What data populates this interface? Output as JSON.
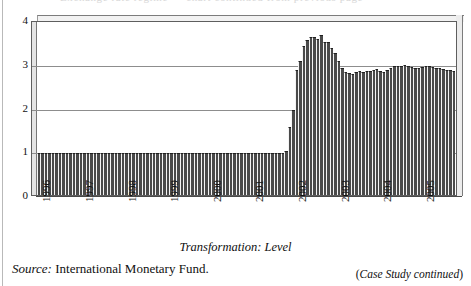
{
  "page": {
    "cutoff_header_ghost": "Exchange rate regime — chart continued from previous page",
    "margin_rule": "page-margin-rule"
  },
  "figure": {
    "transformation_caption": "Transformation: Level",
    "source_label": "Source:",
    "source_text": "International Monetary Fund.",
    "continued_note_open": "(",
    "continued_note_italic": "Case Study continued",
    "continued_note_close": ")"
  },
  "chart_data": {
    "type": "bar",
    "title": "",
    "subtitle": "Transformation: Level",
    "xlabel": "",
    "ylabel": "",
    "ylim": [
      0,
      4
    ],
    "yticks": [
      0,
      1,
      2,
      3,
      4
    ],
    "ytick_labels": [
      "0",
      "1",
      "2",
      "3",
      "4"
    ],
    "grid": true,
    "gridlines_at": [
      1,
      2,
      3
    ],
    "legend": "none",
    "bar_color": "#4a4a4a",
    "x_tick_labels": [
      "1996",
      "1997",
      "1998",
      "1999",
      "2000",
      "2001",
      "2002",
      "2003",
      "2004",
      "2005"
    ],
    "x_tick_label_rotation": -90,
    "x_frequency": "monthly",
    "x_range": [
      "1996-01",
      "2005-12"
    ],
    "series_name": "Exchange rate (level)",
    "categories": [
      "1996-01",
      "1996-02",
      "1996-03",
      "1996-04",
      "1996-05",
      "1996-06",
      "1996-07",
      "1996-08",
      "1996-09",
      "1996-10",
      "1996-11",
      "1996-12",
      "1997-01",
      "1997-02",
      "1997-03",
      "1997-04",
      "1997-05",
      "1997-06",
      "1997-07",
      "1997-08",
      "1997-09",
      "1997-10",
      "1997-11",
      "1997-12",
      "1998-01",
      "1998-02",
      "1998-03",
      "1998-04",
      "1998-05",
      "1998-06",
      "1998-07",
      "1998-08",
      "1998-09",
      "1998-10",
      "1998-11",
      "1998-12",
      "1999-01",
      "1999-02",
      "1999-03",
      "1999-04",
      "1999-05",
      "1999-06",
      "1999-07",
      "1999-08",
      "1999-09",
      "1999-10",
      "1999-11",
      "1999-12",
      "2000-01",
      "2000-02",
      "2000-03",
      "2000-04",
      "2000-05",
      "2000-06",
      "2000-07",
      "2000-08",
      "2000-09",
      "2000-10",
      "2000-11",
      "2000-12",
      "2001-01",
      "2001-02",
      "2001-03",
      "2001-04",
      "2001-05",
      "2001-06",
      "2001-07",
      "2001-08",
      "2001-09",
      "2001-10",
      "2001-11",
      "2001-12",
      "2002-01",
      "2002-02",
      "2002-03",
      "2002-04",
      "2002-05",
      "2002-06",
      "2002-07",
      "2002-08",
      "2002-09",
      "2002-10",
      "2002-11",
      "2002-12",
      "2003-01",
      "2003-02",
      "2003-03",
      "2003-04",
      "2003-05",
      "2003-06",
      "2003-07",
      "2003-08",
      "2003-09",
      "2003-10",
      "2003-11",
      "2003-12",
      "2004-01",
      "2004-02",
      "2004-03",
      "2004-04",
      "2004-05",
      "2004-06",
      "2004-07",
      "2004-08",
      "2004-09",
      "2004-10",
      "2004-11",
      "2004-12",
      "2005-01",
      "2005-02",
      "2005-03",
      "2005-04",
      "2005-05",
      "2005-06",
      "2005-07",
      "2005-08",
      "2005-09",
      "2005-10",
      "2005-11",
      "2005-12"
    ],
    "values": [
      1.0,
      1.0,
      1.0,
      1.0,
      1.0,
      1.0,
      1.0,
      1.0,
      1.0,
      1.0,
      1.0,
      1.0,
      1.0,
      1.0,
      1.0,
      1.0,
      1.0,
      1.0,
      1.0,
      1.0,
      1.0,
      1.0,
      1.0,
      1.0,
      1.0,
      1.0,
      1.0,
      1.0,
      1.0,
      1.0,
      1.0,
      1.0,
      1.0,
      1.0,
      1.0,
      1.0,
      1.0,
      1.0,
      1.0,
      1.0,
      1.0,
      1.0,
      1.0,
      1.0,
      1.0,
      1.0,
      1.0,
      1.0,
      1.0,
      1.0,
      1.0,
      1.0,
      1.0,
      1.0,
      1.0,
      1.0,
      1.0,
      1.0,
      1.0,
      1.0,
      1.0,
      1.0,
      1.0,
      1.0,
      1.0,
      1.0,
      1.0,
      1.0,
      1.0,
      1.0,
      1.0,
      1.05,
      1.6,
      2.0,
      2.9,
      3.1,
      3.45,
      3.6,
      3.65,
      3.65,
      3.62,
      3.7,
      3.55,
      3.55,
      3.4,
      3.3,
      3.1,
      2.95,
      2.85,
      2.83,
      2.82,
      2.85,
      2.88,
      2.85,
      2.87,
      2.88,
      2.9,
      2.92,
      2.88,
      2.85,
      2.9,
      2.95,
      3.0,
      3.0,
      3.0,
      3.02,
      3.0,
      2.98,
      2.95,
      2.96,
      2.98,
      3.0,
      3.0,
      2.98,
      2.95,
      2.95,
      2.92,
      2.9,
      2.9,
      2.88
    ]
  }
}
